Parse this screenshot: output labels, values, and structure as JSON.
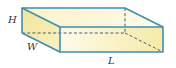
{
  "diagram": {
    "type": "rectangular-prism",
    "labels": {
      "height": "H",
      "width": "W",
      "length": "L"
    },
    "colors": {
      "edge": "#3f8fb0",
      "face_light": "#fdf8dc",
      "face_mid": "#f6eaa8",
      "face_dark": "#efdf90"
    },
    "vertices": {
      "back_top_left": [
        22,
        8
      ],
      "back_top_right": [
        125,
        8
      ],
      "back_bottom_left": [
        22,
        33
      ],
      "back_bottom_right": [
        125,
        33
      ],
      "front_top_left": [
        60,
        27
      ],
      "front_top_right": [
        163,
        27
      ],
      "front_bottom_left": [
        60,
        52
      ],
      "front_bottom_right": [
        163,
        52
      ]
    }
  }
}
